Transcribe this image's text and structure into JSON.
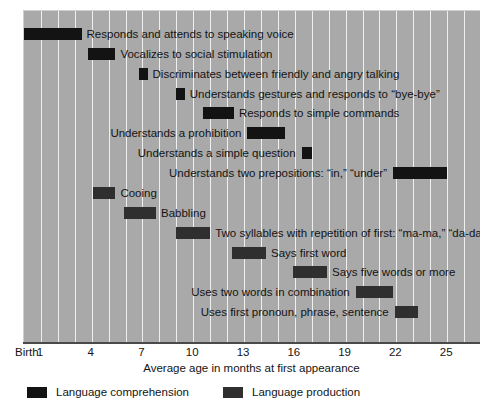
{
  "chart_data": {
    "type": "bar",
    "subtype": "gantt-range",
    "title": "",
    "xlabel": "Average age in months at first appearance",
    "ylabel": "",
    "xlim": [
      0,
      27
    ],
    "tick_labels": [
      "Birth",
      "1",
      "4",
      "7",
      "10",
      "13",
      "16",
      "19",
      "22",
      "25"
    ],
    "tick_values": [
      0,
      1,
      4,
      7,
      10,
      13,
      16,
      19,
      22,
      25
    ],
    "grid": true,
    "legend_position": "bottom-left",
    "series": [
      {
        "name": "Language comprehension",
        "color": "#131313"
      },
      {
        "name": "Language production",
        "color": "#2f2f2f"
      }
    ],
    "bars": [
      {
        "label": "Responds and attends to speaking voice",
        "series": "Language comprehension",
        "start": 0,
        "end": 3.4,
        "label_side": "after"
      },
      {
        "label": "Vocalizes to social stimulation",
        "series": "Language comprehension",
        "start": 3.8,
        "end": 5.4,
        "label_side": "after"
      },
      {
        "label": "Discriminates between friendly and angry talking",
        "series": "Language comprehension",
        "start": 6.8,
        "end": 7.3,
        "label_side": "after"
      },
      {
        "label": "Understands gestures and responds to “bye-bye”",
        "series": "Language comprehension",
        "start": 9.0,
        "end": 9.5,
        "label_side": "after"
      },
      {
        "label": "Responds to simple commands",
        "series": "Language comprehension",
        "start": 10.6,
        "end": 12.4,
        "label_side": "after"
      },
      {
        "label": "Understands a prohibition",
        "series": "Language comprehension",
        "start": 13.2,
        "end": 15.4,
        "label_side": "before"
      },
      {
        "label": "Understands a simple question",
        "series": "Language comprehension",
        "start": 16.4,
        "end": 17.0,
        "label_side": "before"
      },
      {
        "label": "Understands two prepositions: “in,” “under”",
        "series": "Language comprehension",
        "start": 21.8,
        "end": 25.0,
        "label_side": "before"
      },
      {
        "label": "Cooing",
        "series": "Language production",
        "start": 4.1,
        "end": 5.4,
        "label_side": "after"
      },
      {
        "label": "Babbling",
        "series": "Language production",
        "start": 5.9,
        "end": 7.8,
        "label_side": "after"
      },
      {
        "label": "Two syllables with repetition of first: “ma-ma,” “da-da”",
        "series": "Language production",
        "start": 9.0,
        "end": 11.0,
        "label_side": "after"
      },
      {
        "label": "Says first word",
        "series": "Language production",
        "start": 12.3,
        "end": 14.3,
        "label_side": "after"
      },
      {
        "label": "Says five words or more",
        "series": "Language production",
        "start": 15.9,
        "end": 17.9,
        "label_side": "after"
      },
      {
        "label": "Uses two words in combination",
        "series": "Language production",
        "start": 19.6,
        "end": 21.8,
        "label_side": "before"
      },
      {
        "label": "Uses first pronoun, phrase, sentence",
        "series": "Language production",
        "start": 21.9,
        "end": 23.3,
        "label_side": "before"
      }
    ]
  },
  "axis": {
    "title": "Average age in months at first appearance"
  },
  "legend": {
    "items": [
      {
        "label": "Language comprehension",
        "swatch": "comprehension"
      },
      {
        "label": "Language production",
        "swatch": "production"
      }
    ]
  }
}
